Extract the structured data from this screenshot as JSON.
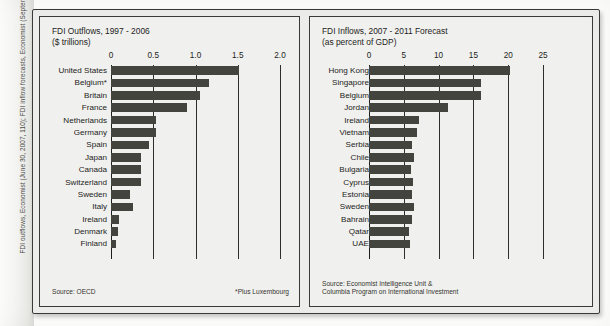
{
  "sidebar": {
    "caption": "FDI outflows, Economist (June 30, 2007, 110); FDI inflow forecasts, Economist (September 15, 2007, 121)."
  },
  "colors": {
    "bar": "#44443f",
    "axis": "#2e2e2c",
    "panel_bg": "#f0f0ee",
    "figure_bg": "#ececea",
    "frame": "#3a3a38",
    "text": "#1d1d1b"
  },
  "left_panel": {
    "title": "FDI Outflows, 1997 - 2006",
    "subtitle": "($ trillions)",
    "source": "Source: OECD",
    "footnote": "*Plus Luxembourg"
  },
  "right_panel": {
    "title": "FDI Inflows, 2007 - 2011 Forecast",
    "subtitle": "(as percent of GDP)",
    "source_line1": "Source: Economist Intelligence Unit &",
    "source_line2": "Columbia Program on International Investment"
  },
  "chart_data": [
    {
      "id": "fdi_outflows",
      "type": "bar",
      "orientation": "horizontal",
      "title": "FDI Outflows, 1997 - 2006",
      "subtitle": "($ trillions)",
      "xlabel": "$ trillions",
      "ylabel": "",
      "xlim": [
        0,
        2.0
      ],
      "ticks": [
        0,
        0.5,
        1.0,
        1.5,
        2.0
      ],
      "tick_labels": [
        "0",
        "0.5",
        "1.0",
        "1.5",
        "2.0"
      ],
      "grid": true,
      "legend": false,
      "source": "Source: OECD",
      "note": "*Plus Luxembourg",
      "categories": [
        "United States",
        "Belgium*",
        "Britain",
        "France",
        "Netherlands",
        "Germany",
        "Spain",
        "Japan",
        "Canada",
        "Switzerland",
        "Sweden",
        "Italy",
        "Ireland",
        "Denmark",
        "Finland"
      ],
      "values": [
        1.52,
        1.16,
        1.05,
        0.9,
        0.53,
        0.53,
        0.45,
        0.36,
        0.36,
        0.36,
        0.22,
        0.26,
        0.1,
        0.08,
        0.06
      ]
    },
    {
      "id": "fdi_inflows_forecast",
      "type": "bar",
      "orientation": "horizontal",
      "title": "FDI Inflows, 2007 - 2011 Forecast",
      "subtitle": "(as percent of GDP)",
      "xlabel": "percent of GDP",
      "ylabel": "",
      "xlim": [
        0,
        25
      ],
      "ticks": [
        0,
        5,
        10,
        15,
        20,
        25
      ],
      "tick_labels": [
        "0",
        "5",
        "10",
        "15",
        "20",
        "25"
      ],
      "grid": true,
      "legend": false,
      "source": "Source: Economist Intelligence Unit & Columbia Program on International Investment",
      "categories": [
        "Hong Kong",
        "Singapore",
        "Belgium",
        "Jordan",
        "Ireland",
        "Vietnam",
        "Serbia",
        "Chile",
        "Bulgaria",
        "Cyprus",
        "Estonia",
        "Sweden",
        "Bahrain",
        "Qatar",
        "UAE"
      ],
      "values": [
        20.2,
        16.1,
        16.1,
        11.4,
        7.2,
        6.9,
        6.2,
        6.5,
        6.1,
        6.3,
        6.2,
        6.4,
        6.2,
        5.8,
        5.9
      ]
    }
  ]
}
